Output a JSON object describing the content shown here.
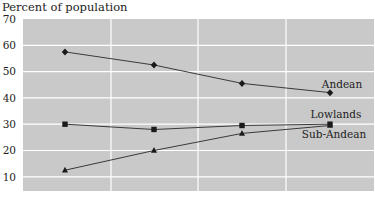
{
  "chart_data": {
    "type": "line",
    "title": "",
    "ylabel": "Percent of population",
    "xlabel": "",
    "ylim": [
      5,
      70
    ],
    "yticks": [
      10,
      20,
      30,
      40,
      50,
      60,
      70
    ],
    "grid": true,
    "legend_position": "inline labels at right end of lines",
    "x": [
      1,
      2,
      3,
      4
    ],
    "xtick_labels": [],
    "series": [
      {
        "name": "Andean",
        "marker": "diamond",
        "values": [
          57.5,
          52.5,
          45.5,
          42
        ]
      },
      {
        "name": "Lowlands",
        "marker": "square",
        "values": [
          30,
          28,
          29.5,
          30
        ]
      },
      {
        "name": "Sub-Andean",
        "marker": "triangle",
        "values": [
          12.5,
          20,
          26.5,
          29.5
        ]
      }
    ]
  },
  "axis": {
    "title": "Percent of population",
    "ticks": [
      "70",
      "60",
      "50",
      "40",
      "30",
      "20",
      "10"
    ]
  },
  "labels": {
    "andean": "Andean",
    "lowlands": "Lowlands",
    "sub_andean": "Sub-Andean"
  },
  "colors": {
    "plot_background": "#c9c9c9",
    "gridline": "#ffffff",
    "line": "#3a3a3a",
    "marker": "#1a1a1a",
    "text": "#222222"
  }
}
